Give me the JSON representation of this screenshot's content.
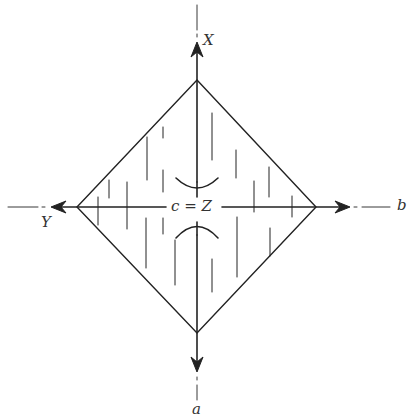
{
  "diagram": {
    "type": "crystal-axes-rhombus",
    "labels": {
      "top": "X",
      "left": "Y",
      "right": "b",
      "bottom": "a",
      "center": "c = Z"
    },
    "colors": {
      "stroke": "#222222",
      "background": "#ffffff",
      "text": "#333333"
    }
  }
}
